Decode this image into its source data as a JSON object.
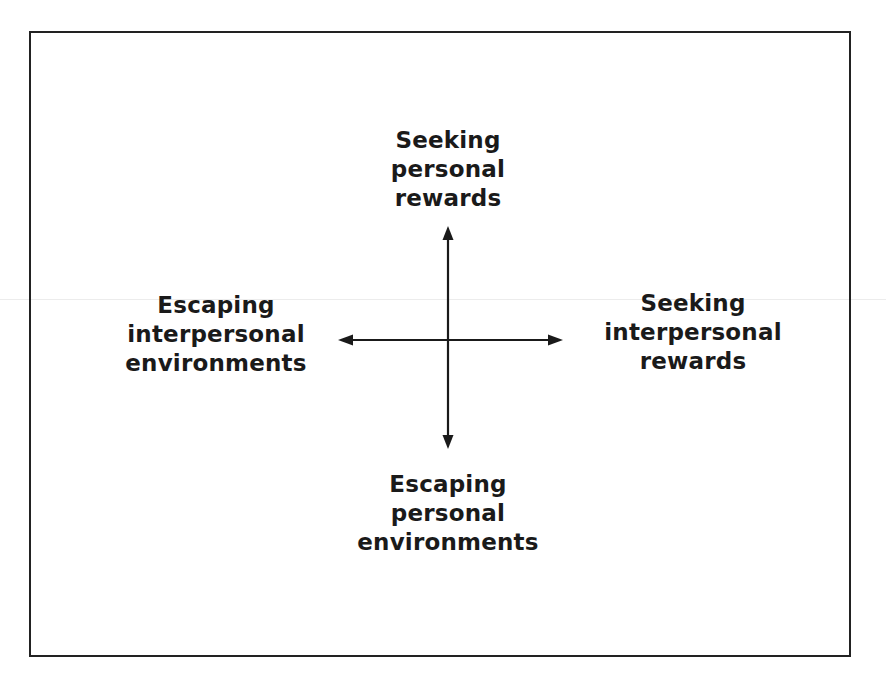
{
  "diagram": {
    "type": "two-axis motivational model",
    "axes": {
      "vertical": {
        "top": {
          "lines": [
            "Seeking",
            "personal",
            "rewards"
          ]
        },
        "bottom": {
          "lines": [
            "Escaping",
            "personal",
            "environments"
          ]
        }
      },
      "horizontal": {
        "left": {
          "lines": [
            "Escaping",
            "interpersonal",
            "environments"
          ]
        },
        "right": {
          "lines": [
            "Seeking",
            "interpersonal",
            "rewards"
          ]
        }
      }
    },
    "colors": {
      "ink": "#1a1a1a",
      "border": "#222222",
      "background": "#ffffff"
    }
  }
}
